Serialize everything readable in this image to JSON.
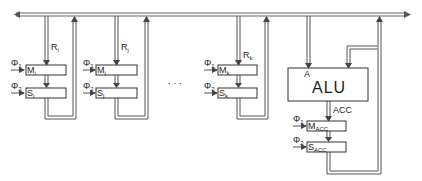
{
  "diagram": {
    "type": "register-bus-architecture",
    "bus": {
      "label": ""
    },
    "registers": [
      {
        "name": "i",
        "line_label": "R",
        "line_sub": "i",
        "master": "M",
        "master_sub": "i",
        "slave": "S",
        "slave_sub": "i",
        "clock1": "Φ",
        "clock1_sub": "1",
        "clock2": "Φ",
        "clock2_sub": "2"
      },
      {
        "name": "j",
        "line_label": "R",
        "line_sub": "j",
        "master": "M",
        "master_sub": "j",
        "slave": "S",
        "slave_sub": "j",
        "clock1": "Φ",
        "clock1_sub": "1",
        "clock2": "Φ",
        "clock2_sub": "2"
      },
      {
        "name": "k",
        "line_label": "R",
        "line_sub": "k",
        "master": "M",
        "master_sub": "k",
        "slave": "S",
        "slave_sub": "k",
        "clock1": "Φ",
        "clock1_sub": "1",
        "clock2": "Φ",
        "clock2_sub": "2"
      }
    ],
    "ellipsis": "· · ·",
    "alu": {
      "label": "ALU",
      "input_a": "A",
      "output_label": "ACC",
      "master": "M",
      "master_sub": "ACC",
      "slave": "S",
      "slave_sub": "ACC",
      "clock1": "Φ",
      "clock1_sub": "1",
      "clock2": "Φ",
      "clock2_sub": "2"
    },
    "colors": {
      "line": "#555555",
      "box": "#333333",
      "background": "#ffffff"
    }
  }
}
